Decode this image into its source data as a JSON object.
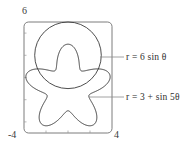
{
  "figure": {
    "kind": "polar-curve-plot",
    "background": "#ffffff",
    "curve_color": "#3a3a3a",
    "frame_color": "#6e6e6e",
    "leader_color": "#8a8a8a",
    "text_color": "#2e2e2e"
  },
  "axes": {
    "y_max_label": "6",
    "x_min_label": "-4",
    "x_max_label": "4",
    "xlim": [
      -4,
      4
    ],
    "ylim": [
      -4,
      6
    ],
    "x_ticks": [
      -2,
      0,
      2
    ],
    "y_ticks": [
      -2,
      0,
      2,
      4
    ],
    "grid": false,
    "frame": "rounded-rectangle"
  },
  "annotations": [
    {
      "id": "eq-circle",
      "text": "r = 6 sin θ",
      "lhs": "r",
      "rhs": "= 6 sin θ",
      "target_curve": "circle"
    },
    {
      "id": "eq-rose",
      "text": "r = 3 + sin 5θ",
      "lhs": "r",
      "rhs": "= 3 + sin 5θ",
      "target_curve": "rose"
    }
  ],
  "chart_data": {
    "type": "line",
    "title": "",
    "xlabel": "",
    "ylabel": "",
    "xlim": [
      -4,
      4
    ],
    "ylim": [
      -4,
      6
    ],
    "grid": false,
    "legend_position": "right-inline-callouts",
    "coordinate_system": "polar",
    "series": [
      {
        "name": "r = 6 sin θ",
        "equation": "r = 6*sin(theta)",
        "amplitude": 6,
        "shape": "circle",
        "center": [
          0,
          3
        ],
        "radius": 3,
        "theta_range_deg": [
          0,
          180
        ],
        "r_min": 0,
        "r_max": 6
      },
      {
        "name": "r = 3 + sin 5θ",
        "equation": "r = 3 + sin(5*theta)",
        "shape": "five-lobed-limacon",
        "offset": 3,
        "petal_amplitude": 1,
        "petal_count": 5,
        "theta_range_deg": [
          0,
          360
        ],
        "r_min": 2,
        "r_max": 4
      }
    ]
  }
}
